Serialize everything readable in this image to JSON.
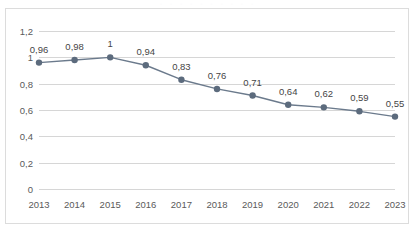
{
  "title_remnant": "∙ ∙ ∙ ∙ ∙ ∙ ∙ ∙ ∙ ∙",
  "chart_data": {
    "type": "line",
    "title": "",
    "xlabel": "",
    "ylabel": "",
    "categories": [
      "2013",
      "2014",
      "2015",
      "2016",
      "2017",
      "2018",
      "2019",
      "2020",
      "2021",
      "2022",
      "2023"
    ],
    "values": [
      0.96,
      0.98,
      1,
      0.94,
      0.83,
      0.76,
      0.71,
      0.64,
      0.62,
      0.59,
      0.55
    ],
    "point_labels": [
      "0,96",
      "0,98",
      "1",
      "0,94",
      "0,83",
      "0,76",
      "0,71",
      "0,64",
      "0,62",
      "0,59",
      "0,55"
    ],
    "ylim": [
      0,
      1.2
    ],
    "yticks": [
      0,
      0.2,
      0.4,
      0.6,
      0.8,
      1,
      1.2
    ],
    "ytick_labels": [
      "0",
      "0,2",
      "0,4",
      "0,6",
      "0,8",
      "1",
      "1,2"
    ],
    "grid": true,
    "legend": "none",
    "series": [
      {
        "name": "series-1",
        "values": [
          0.96,
          0.98,
          1,
          0.94,
          0.83,
          0.76,
          0.71,
          0.64,
          0.62,
          0.59,
          0.55
        ]
      }
    ],
    "colors": {
      "line": "#6b7a8c",
      "marker": "#5c6b7d",
      "gridline": "#d6d6d6",
      "axis_text": "#5a5a5a",
      "label_text": "#454545",
      "frame": "#dcdcdc",
      "background": "#ffffff"
    },
    "marker": {
      "shape": "circle",
      "radius": 3.2
    }
  }
}
